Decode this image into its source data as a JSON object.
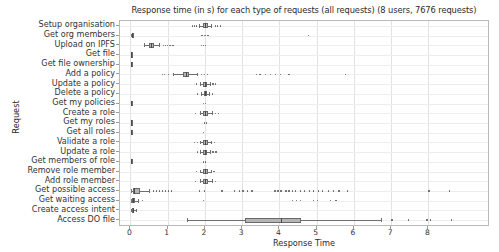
{
  "chart_data": {
    "type": "boxplot",
    "title": "Response time (in s) for each type of requests (all requests) (8 users, 7676 requests)",
    "xlabel": "Response Time",
    "ylabel": "Request",
    "orientation": "horizontal",
    "grid": true,
    "legend": "none",
    "xlim": [
      -0.28,
      9.6
    ],
    "xticks": [
      0,
      1,
      2,
      3,
      4,
      5,
      6,
      7,
      8
    ],
    "xtick_labels": [
      "0",
      "1",
      "2",
      "3",
      "4",
      "5",
      "6",
      "7",
      "8"
    ],
    "categories": [
      "Setup organisation",
      "Get org members",
      "Upload on IPFS",
      "Get file",
      "Get file ownership",
      "Add a policy",
      "Update a policy",
      "Delete a policy",
      "Get my policies",
      "Create a role",
      "Get my roles",
      "Get all roles",
      "Validate a role",
      "Update a role",
      "Get members of role",
      "Remove role member",
      "Add role member",
      "Get possible access",
      "Get waiting access",
      "Create access intent",
      "Access DO file"
    ],
    "boxes": [
      {
        "label": "Setup organisation",
        "whisker_low": 1.84,
        "q1": 1.94,
        "median": 2.01,
        "q3": 2.08,
        "whisker_high": 2.16,
        "fliers": [
          1.66,
          1.72,
          1.78,
          2.28,
          2.34,
          2.42
        ]
      },
      {
        "label": "Get org members",
        "whisker_low": 0.02,
        "q1": 0.03,
        "median": 0.035,
        "q3": 0.045,
        "whisker_high": 0.06,
        "fliers": [
          1.92,
          1.98,
          2.02,
          2.08,
          4.78
        ]
      },
      {
        "label": "Upload on IPFS",
        "whisker_low": 0.36,
        "q1": 0.5,
        "median": 0.56,
        "q3": 0.62,
        "whisker_high": 0.78,
        "fliers": [
          0.88,
          0.94,
          1.0,
          1.06,
          1.14,
          1.9,
          1.96,
          2.02
        ]
      },
      {
        "label": "Get file",
        "whisker_low": 0.01,
        "q1": 0.02,
        "median": 0.025,
        "q3": 0.03,
        "whisker_high": 0.04,
        "fliers": []
      },
      {
        "label": "Get file ownership",
        "whisker_low": 0.01,
        "q1": 0.02,
        "median": 0.025,
        "q3": 0.03,
        "whisker_high": 0.04,
        "fliers": []
      },
      {
        "label": "Add a policy",
        "whisker_low": 1.14,
        "q1": 1.4,
        "median": 1.48,
        "q3": 1.58,
        "whisker_high": 1.8,
        "fliers": [
          0.86,
          0.92,
          1.02,
          1.9,
          1.98,
          2.06,
          3.38,
          3.48,
          3.62,
          3.76,
          3.9,
          4.02,
          4.26,
          5.78
        ]
      },
      {
        "label": "Update a policy",
        "whisker_low": 1.88,
        "q1": 1.96,
        "median": 2.0,
        "q3": 2.06,
        "whisker_high": 2.14,
        "fliers": [
          1.78,
          2.22,
          2.28
        ]
      },
      {
        "label": "Delete a policy",
        "whisker_low": 1.9,
        "q1": 1.97,
        "median": 2.01,
        "q3": 2.05,
        "whisker_high": 2.12,
        "fliers": [
          1.8,
          2.2
        ]
      },
      {
        "label": "Get my policies",
        "whisker_low": 0.01,
        "q1": 0.02,
        "median": 0.025,
        "q3": 0.03,
        "whisker_high": 0.04,
        "fliers": [
          1.96,
          2.02
        ]
      },
      {
        "label": "Create a role",
        "whisker_low": 1.86,
        "q1": 1.95,
        "median": 2.0,
        "q3": 2.07,
        "whisker_high": 2.18,
        "fliers": [
          1.74,
          2.28,
          2.36
        ]
      },
      {
        "label": "Get my roles",
        "whisker_low": 0.01,
        "q1": 0.02,
        "median": 0.025,
        "q3": 0.03,
        "whisker_high": 0.04,
        "fliers": [
          1.98,
          2.04
        ]
      },
      {
        "label": "Get all roles",
        "whisker_low": 0.01,
        "q1": 0.02,
        "median": 0.025,
        "q3": 0.03,
        "whisker_high": 0.04,
        "fliers": [
          1.96
        ]
      },
      {
        "label": "Validate a role",
        "whisker_low": 1.88,
        "q1": 1.96,
        "median": 2.01,
        "q3": 2.07,
        "whisker_high": 2.16,
        "fliers": [
          1.72,
          1.8,
          2.26
        ]
      },
      {
        "label": "Update a role",
        "whisker_low": 1.88,
        "q1": 1.96,
        "median": 2.01,
        "q3": 2.06,
        "whisker_high": 2.14,
        "fliers": [
          1.8,
          2.22,
          2.3
        ]
      },
      {
        "label": "Get members of role",
        "whisker_low": 0.01,
        "q1": 0.02,
        "median": 0.025,
        "q3": 0.035,
        "whisker_high": 0.05,
        "fliers": [
          1.96,
          2.02
        ]
      },
      {
        "label": "Remove role member",
        "whisker_low": 1.88,
        "q1": 1.96,
        "median": 2.01,
        "q3": 2.07,
        "whisker_high": 2.16,
        "fliers": [
          1.78,
          2.24
        ]
      },
      {
        "label": "Add role member",
        "whisker_low": 1.86,
        "q1": 1.95,
        "median": 2.0,
        "q3": 2.07,
        "whisker_high": 2.18,
        "fliers": [
          1.74,
          2.28
        ]
      },
      {
        "label": "Get possible access",
        "whisker_low": 0.02,
        "q1": 0.06,
        "median": 0.1,
        "q3": 0.26,
        "whisker_high": 0.5,
        "fliers": [
          0.62,
          0.7,
          0.78,
          0.86,
          0.94,
          1.02,
          1.1,
          1.86,
          1.98,
          2.46,
          2.8,
          2.92,
          3.02,
          3.14,
          3.26,
          3.88,
          3.96,
          4.04,
          4.18,
          4.26,
          4.36,
          4.44,
          4.56,
          4.68,
          4.8,
          4.92,
          5.04,
          5.16,
          5.32,
          5.46,
          5.6,
          5.82,
          8.02,
          8.56
        ]
      },
      {
        "label": "Get waiting access",
        "whisker_low": 0.02,
        "q1": 0.04,
        "median": 0.06,
        "q3": 0.11,
        "whisker_high": 0.2,
        "fliers": [
          0.32,
          1.96,
          4.36,
          4.46,
          4.56,
          4.92,
          5.02,
          5.38,
          5.52
        ]
      },
      {
        "label": "Create access intent",
        "whisker_low": 0.02,
        "q1": 0.04,
        "median": 0.06,
        "q3": 0.09,
        "whisker_high": 0.14,
        "fliers": []
      },
      {
        "label": "Access DO file",
        "whisker_low": 1.52,
        "q1": 3.07,
        "median": 4.03,
        "q3": 4.59,
        "whisker_high": 6.74,
        "fliers": [
          7.02,
          7.46,
          7.96,
          8.06,
          8.62
        ]
      }
    ]
  }
}
